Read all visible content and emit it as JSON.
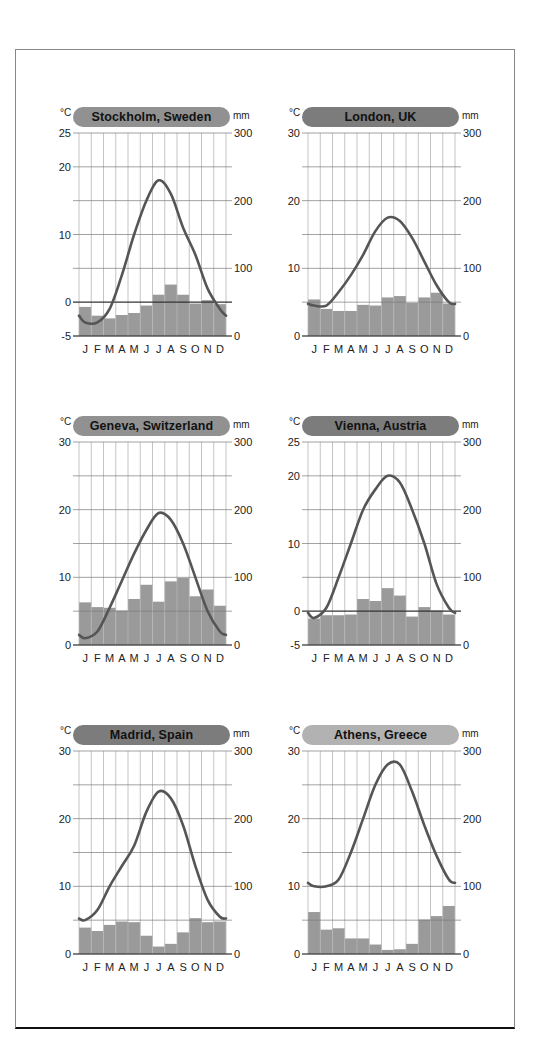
{
  "months": [
    "J",
    "F",
    "M",
    "A",
    "M",
    "J",
    "J",
    "A",
    "S",
    "O",
    "N",
    "D"
  ],
  "axis_units": {
    "temp": "°C",
    "precip": "mm"
  },
  "colors": {
    "bar": "#9a9a9a",
    "line": "#555555",
    "grid": "#7a7a7a",
    "vgrid": "#b5b5b5",
    "zero_line": "#333333"
  },
  "chart_data": [
    {
      "type": "bar+line",
      "title": "Stockholm, Sweden",
      "pill_color": "#919191",
      "temp_range": [
        -5,
        25
      ],
      "temp_ticks": [
        -5,
        0,
        10,
        20,
        25
      ],
      "precip_range": [
        0,
        300
      ],
      "precip_ticks": [
        0,
        100,
        200,
        300
      ],
      "categories": [
        "J",
        "F",
        "M",
        "A",
        "M",
        "J",
        "J",
        "A",
        "S",
        "O",
        "N",
        "D"
      ],
      "series": [
        {
          "name": "Temperature (°C)",
          "kind": "line",
          "values": [
            -3,
            -3,
            -1,
            4,
            10,
            15,
            18,
            16,
            11,
            7,
            2,
            -1
          ]
        },
        {
          "name": "Precipitation (mm)",
          "kind": "bar",
          "values": [
            43,
            30,
            26,
            31,
            34,
            45,
            61,
            76,
            61,
            48,
            53,
            47
          ]
        }
      ]
    },
    {
      "type": "bar+line",
      "title": "London, UK",
      "pill_color": "#7c7c7c",
      "temp_range": [
        0,
        30
      ],
      "temp_ticks": [
        0,
        10,
        20,
        30
      ],
      "precip_range": [
        0,
        300
      ],
      "precip_ticks": [
        0,
        100,
        200,
        300
      ],
      "categories": [
        "J",
        "F",
        "M",
        "A",
        "M",
        "J",
        "J",
        "A",
        "S",
        "O",
        "N",
        "D"
      ],
      "series": [
        {
          "name": "Temperature (°C)",
          "kind": "line",
          "values": [
            4.5,
            4.5,
            6.5,
            9,
            12,
            15.5,
            17.5,
            17,
            14.5,
            11,
            7.5,
            5
          ]
        },
        {
          "name": "Precipitation (mm)",
          "kind": "bar",
          "values": [
            54,
            40,
            37,
            37,
            46,
            45,
            57,
            59,
            49,
            57,
            64,
            48
          ]
        }
      ]
    },
    {
      "type": "bar+line",
      "title": "Geneva, Switzerland",
      "pill_color": "#919191",
      "temp_range": [
        0,
        30
      ],
      "temp_ticks": [
        0,
        10,
        20,
        30
      ],
      "precip_range": [
        0,
        300
      ],
      "precip_ticks": [
        0,
        100,
        200,
        300
      ],
      "categories": [
        "J",
        "F",
        "M",
        "A",
        "M",
        "J",
        "J",
        "A",
        "S",
        "O",
        "N",
        "D"
      ],
      "series": [
        {
          "name": "Temperature (°C)",
          "kind": "line",
          "values": [
            1,
            2,
            5.5,
            9.5,
            13.5,
            17,
            19.5,
            18.5,
            15,
            10,
            5,
            2
          ]
        },
        {
          "name": "Precipitation (mm)",
          "kind": "bar",
          "values": [
            63,
            56,
            55,
            51,
            68,
            89,
            64,
            94,
            99,
            72,
            82,
            58
          ]
        }
      ]
    },
    {
      "type": "bar+line",
      "title": "Vienna, Austria",
      "pill_color": "#7c7c7c",
      "temp_range": [
        -5,
        25
      ],
      "temp_ticks": [
        -5,
        0,
        10,
        20,
        25
      ],
      "precip_range": [
        0,
        300
      ],
      "precip_ticks": [
        0,
        100,
        200,
        300
      ],
      "categories": [
        "J",
        "F",
        "M",
        "A",
        "M",
        "J",
        "J",
        "A",
        "S",
        "O",
        "N",
        "D"
      ],
      "series": [
        {
          "name": "Temperature (°C)",
          "kind": "line",
          "values": [
            -1,
            0.5,
            5,
            10,
            15,
            18,
            20,
            19,
            15,
            10,
            4,
            0.5
          ]
        },
        {
          "name": "Precipitation (mm)",
          "kind": "bar",
          "values": [
            39,
            44,
            44,
            45,
            68,
            65,
            84,
            73,
            42,
            56,
            51,
            45
          ]
        }
      ]
    },
    {
      "type": "bar+line",
      "title": "Madrid, Spain",
      "pill_color": "#7c7c7c",
      "temp_range": [
        0,
        30
      ],
      "temp_ticks": [
        0,
        10,
        20,
        30
      ],
      "precip_range": [
        0,
        300
      ],
      "precip_ticks": [
        0,
        100,
        200,
        300
      ],
      "categories": [
        "J",
        "F",
        "M",
        "A",
        "M",
        "J",
        "J",
        "A",
        "S",
        "O",
        "N",
        "D"
      ],
      "series": [
        {
          "name": "Temperature (°C)",
          "kind": "line",
          "values": [
            5,
            6.5,
            10,
            13,
            16,
            21,
            24,
            23,
            19,
            13,
            8,
            5.5
          ]
        },
        {
          "name": "Precipitation (mm)",
          "kind": "bar",
          "values": [
            39,
            34,
            43,
            48,
            47,
            27,
            11,
            15,
            32,
            53,
            47,
            48
          ]
        }
      ]
    },
    {
      "type": "bar+line",
      "title": "Athens, Greece",
      "pill_color": "#b2b2b2",
      "temp_range": [
        0,
        30
      ],
      "temp_ticks": [
        0,
        10,
        20,
        30
      ],
      "precip_range": [
        0,
        300
      ],
      "precip_ticks": [
        0,
        100,
        200,
        300
      ],
      "categories": [
        "J",
        "F",
        "M",
        "A",
        "M",
        "J",
        "J",
        "A",
        "S",
        "O",
        "N",
        "D"
      ],
      "series": [
        {
          "name": "Temperature (°C)",
          "kind": "line",
          "values": [
            10,
            10,
            11,
            15,
            20,
            25,
            28,
            28,
            24,
            19,
            14.5,
            11
          ]
        },
        {
          "name": "Precipitation (mm)",
          "kind": "bar",
          "values": [
            62,
            36,
            38,
            23,
            23,
            14,
            6,
            7,
            15,
            51,
            56,
            71
          ]
        }
      ]
    }
  ]
}
